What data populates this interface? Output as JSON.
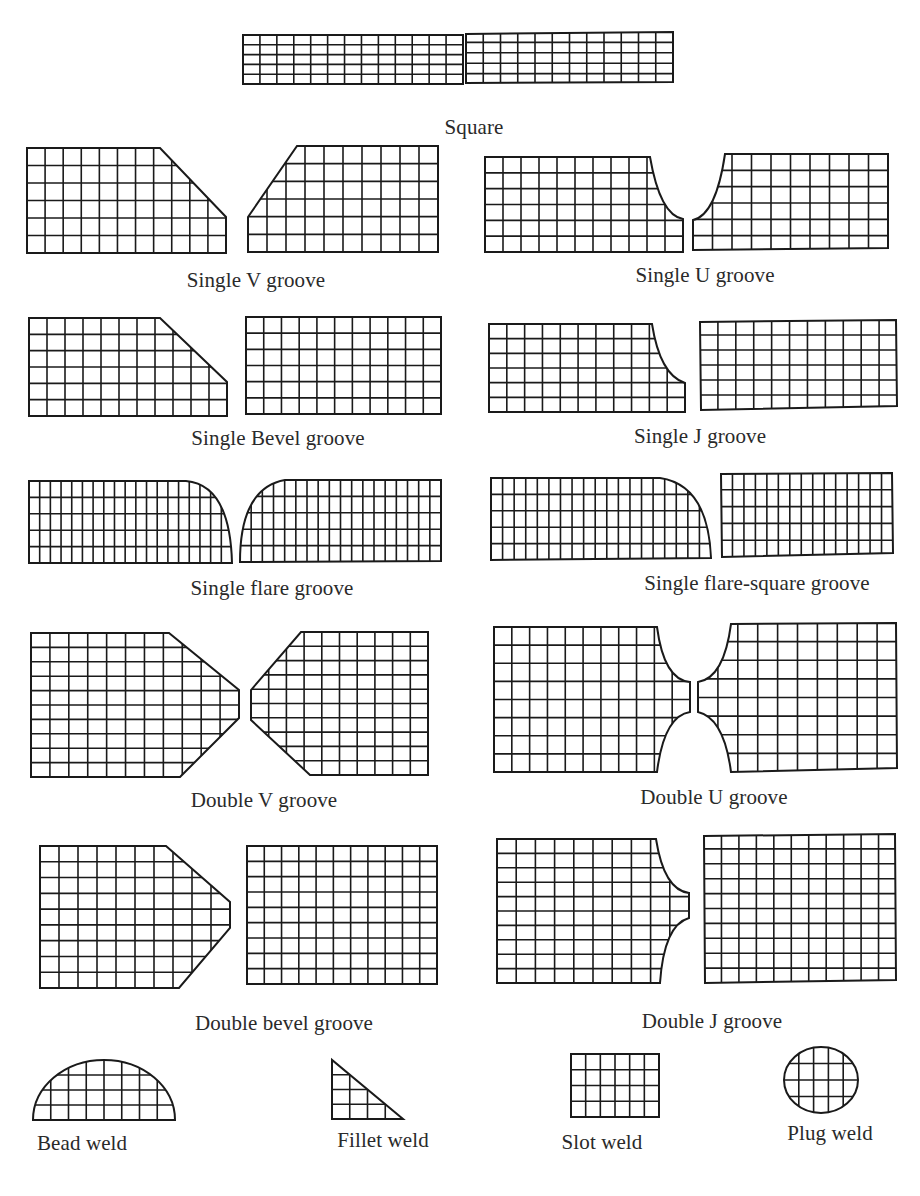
{
  "diagram": {
    "colors": {
      "stroke": "#1a1a1a",
      "text": "#2a2a2a",
      "background": "#ffffff"
    },
    "joints": [
      {
        "id": "square",
        "label": "Square",
        "label_pos": [
          474,
          127
        ],
        "label_align": "center",
        "parts": [
          {
            "path": "M243,35 L463,35 L463,84 L243,84 Z",
            "x0": 243,
            "y0": 35,
            "x1": 463,
            "y1": 84,
            "cols": 13,
            "rows": 5
          },
          {
            "path": "M466,34 L673,32 L673,82 L466,83 Z",
            "x0": 466,
            "y0": 32,
            "x1": 673,
            "y1": 84,
            "cols": 12,
            "rows": 5
          }
        ]
      },
      {
        "id": "single-v-groove",
        "label": "Single V groove",
        "label_pos": [
          256,
          280
        ],
        "label_align": "center",
        "parts": [
          {
            "path": "M27,148 L160,148 L226,217 L226,253 L27,253 Z",
            "x0": 27,
            "y0": 148,
            "x1": 226,
            "y1": 253,
            "cols": 11,
            "rows": 6
          },
          {
            "path": "M297,146 L438,146 L438,252 L248,252 L248,217 Z",
            "x0": 248,
            "y0": 146,
            "x1": 438,
            "y1": 252,
            "cols": 10,
            "rows": 6
          }
        ]
      },
      {
        "id": "single-u-groove",
        "label": "Single U groove",
        "label_pos": [
          705,
          275
        ],
        "label_align": "center",
        "parts": [
          {
            "path": "M485,157 L650,157 Q660,215 683,219 L683,252 L485,252 Z",
            "x0": 485,
            "y0": 157,
            "x1": 683,
            "y1": 252,
            "cols": 11,
            "rows": 6
          },
          {
            "path": "M725,154 L888,154 L888,248 L693,250 L693,220 Q716,215 725,154 Z",
            "x0": 693,
            "y0": 154,
            "x1": 888,
            "y1": 252,
            "cols": 10,
            "rows": 6
          }
        ]
      },
      {
        "id": "single-bevel-groove",
        "label": "Single Bevel groove",
        "label_pos": [
          278,
          438
        ],
        "label_align": "center",
        "parts": [
          {
            "path": "M29,318 L160,318 L227,382 L227,416 L29,416 Z",
            "x0": 29,
            "y0": 318,
            "x1": 227,
            "y1": 416,
            "cols": 11,
            "rows": 6
          },
          {
            "path": "M246,317 L441,317 L441,414 L246,414 Z",
            "x0": 246,
            "y0": 317,
            "x1": 441,
            "y1": 414,
            "cols": 11,
            "rows": 6
          }
        ]
      },
      {
        "id": "single-j-groove",
        "label": "Single J groove",
        "label_pos": [
          700,
          436
        ],
        "label_align": "center",
        "parts": [
          {
            "path": "M489,324 L652,324 Q660,375 685,383 L685,412 L489,412 Z",
            "x0": 489,
            "y0": 324,
            "x1": 685,
            "y1": 412,
            "cols": 11,
            "rows": 6
          },
          {
            "path": "M700,322 L896,320 L897,406 L701,410 Z",
            "x0": 700,
            "y0": 320,
            "x1": 897,
            "y1": 410,
            "cols": 11,
            "rows": 6
          }
        ]
      },
      {
        "id": "single-flare-groove",
        "label": "Single flare groove",
        "label_pos": [
          272,
          588
        ],
        "label_align": "center",
        "parts": [
          {
            "path": "M29,481 L186,481 Q230,485 232,563 L29,563 Z",
            "x0": 29,
            "y0": 481,
            "x1": 232,
            "y1": 563,
            "cols": 19,
            "rows": 5
          },
          {
            "path": "M285,480 L441,480 L441,561 L240,562 Q240,488 285,480 Z",
            "x0": 240,
            "y0": 480,
            "x1": 441,
            "y1": 562,
            "cols": 18,
            "rows": 5
          }
        ]
      },
      {
        "id": "single-flare-square-groove",
        "label": "Single flare-square groove",
        "label_pos": [
          757,
          583
        ],
        "label_align": "center",
        "parts": [
          {
            "path": "M491,478 L660,478 Q708,485 711,558 L491,560 Z",
            "x0": 491,
            "y0": 478,
            "x1": 711,
            "y1": 560,
            "cols": 19,
            "rows": 5
          },
          {
            "path": "M721,474 L892,473 L893,553 L722,557 Z",
            "x0": 721,
            "y0": 473,
            "x1": 893,
            "y1": 557,
            "cols": 15,
            "rows": 5
          }
        ]
      },
      {
        "id": "double-v-groove",
        "label": "Double V groove",
        "label_pos": [
          264,
          800
        ],
        "label_align": "center",
        "parts": [
          {
            "path": "M31,633 L169,633 L239,690 L239,718 L180,777 L31,777 Z",
            "x0": 31,
            "y0": 633,
            "x1": 239,
            "y1": 777,
            "cols": 11,
            "rows": 10
          },
          {
            "path": "M301,632 L428,632 L428,775 L310,775 L251,720 L251,690 Z",
            "x0": 251,
            "y0": 632,
            "x1": 428,
            "y1": 775,
            "cols": 10,
            "rows": 10
          }
        ]
      },
      {
        "id": "double-u-groove",
        "label": "Double U groove",
        "label_pos": [
          714,
          797
        ],
        "label_align": "center",
        "parts": [
          {
            "path": "M494,627 L657,627 Q664,680 690,682 L690,712 Q664,716 657,772 L494,772 Z",
            "x0": 494,
            "y0": 627,
            "x1": 690,
            "y1": 772,
            "cols": 11,
            "rows": 8
          },
          {
            "path": "M731,624 L896,623 L897,768 L731,772 Q724,718 698,712 L698,682 Q724,678 731,624 Z",
            "x0": 698,
            "y0": 623,
            "x1": 897,
            "y1": 772,
            "cols": 10,
            "rows": 8
          }
        ]
      },
      {
        "id": "double-bevel-groove",
        "label": "Double bevel groove",
        "label_pos": [
          284,
          1023
        ],
        "label_align": "center",
        "parts": [
          {
            "path": "M40,846 L166,846 L230,902 L230,928 L179,988 L40,988 Z",
            "x0": 40,
            "y0": 846,
            "x1": 230,
            "y1": 988,
            "cols": 10,
            "rows": 9
          },
          {
            "path": "M247,846 L437,846 L437,984 L247,984 Z",
            "x0": 247,
            "y0": 846,
            "x1": 437,
            "y1": 984,
            "cols": 11,
            "rows": 9
          }
        ]
      },
      {
        "id": "double-j-groove",
        "label": "Double J groove",
        "label_pos": [
          712,
          1021
        ],
        "label_align": "center",
        "parts": [
          {
            "path": "M497,839 L656,839 Q664,890 689,893 L689,918 Q664,925 660,983 L497,983 Z",
            "x0": 497,
            "y0": 839,
            "x1": 689,
            "y1": 983,
            "cols": 10,
            "rows": 10
          },
          {
            "path": "M704,836 L895,834 L896,980 L705,983 Z",
            "x0": 704,
            "y0": 834,
            "x1": 896,
            "y1": 983,
            "cols": 11,
            "rows": 10
          }
        ]
      },
      {
        "id": "bead-weld",
        "label": "Bead weld",
        "label_pos": [
          37,
          1143
        ],
        "label_align": "left",
        "parts": [
          {
            "path": "M33,1120 A71,60 0 0 1 175,1120 Z",
            "x0": 33,
            "y0": 1060,
            "x1": 175,
            "y1": 1120,
            "cols": 8,
            "rows": 4
          }
        ]
      },
      {
        "id": "fillet-weld",
        "label": "Fillet weld",
        "label_pos": [
          383,
          1140
        ],
        "label_align": "center",
        "parts": [
          {
            "path": "M332,1060 L332,1119 L403,1119 Z",
            "x0": 332,
            "y0": 1060,
            "x1": 403,
            "y1": 1119,
            "cols": 4,
            "rows": 4
          }
        ]
      },
      {
        "id": "slot-weld",
        "label": "Slot weld",
        "label_pos": [
          602,
          1142
        ],
        "label_align": "center",
        "parts": [
          {
            "path": "M571,1054 L659,1054 L659,1117 L571,1117 Z",
            "x0": 571,
            "y0": 1054,
            "x1": 659,
            "y1": 1117,
            "cols": 6,
            "rows": 4
          }
        ]
      },
      {
        "id": "plug-weld",
        "label": "Plug weld",
        "label_pos": [
          830,
          1133
        ],
        "label_align": "center",
        "parts": [
          {
            "path": "M784,1080 A37,33 0 1 1 858,1080 A37,33 0 1 1 784,1080 Z",
            "x0": 784,
            "y0": 1047,
            "x1": 858,
            "y1": 1113,
            "cols": 5,
            "rows": 4
          }
        ]
      }
    ]
  }
}
